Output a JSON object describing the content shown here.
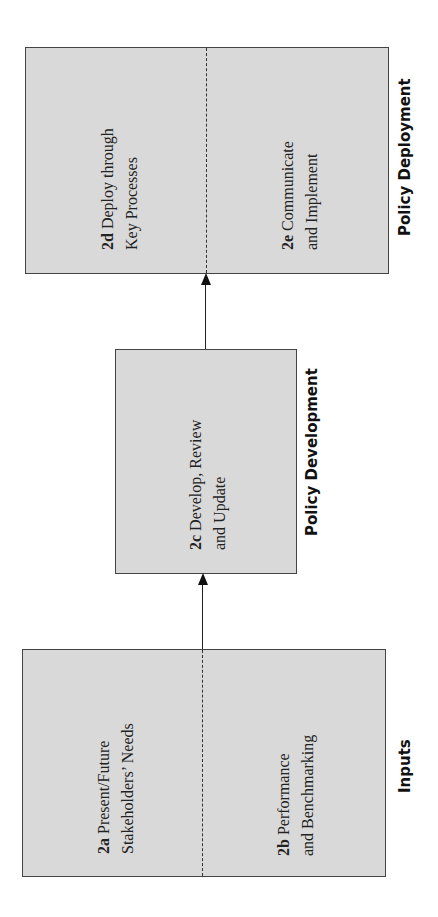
{
  "diagram": {
    "orientation": "rotated -90deg (reads bottom-to-top)",
    "fill_color": "#d9d9d9",
    "stages": [
      {
        "label": "Inputs",
        "items": [
          {
            "code": "2a",
            "line1": "Present/Future",
            "line2": "Stakeholders’ Needs"
          },
          {
            "code": "2b",
            "line1": "Performance",
            "line2": "and Benchmarking"
          }
        ]
      },
      {
        "label": "Policy Development",
        "items": [
          {
            "code": "2c",
            "line1": "Develop, Review",
            "line2": "and Update"
          }
        ]
      },
      {
        "label": "Policy Deployment",
        "items": [
          {
            "code": "2d",
            "line1": "Deploy through",
            "line2": "Key Processes"
          },
          {
            "code": "2e",
            "line1": "Communicate",
            "line2": "and Implement"
          }
        ]
      }
    ],
    "connections": [
      {
        "from": "Inputs",
        "to": "Policy Development"
      },
      {
        "from": "Policy Development",
        "to": "Policy Deployment"
      }
    ]
  }
}
